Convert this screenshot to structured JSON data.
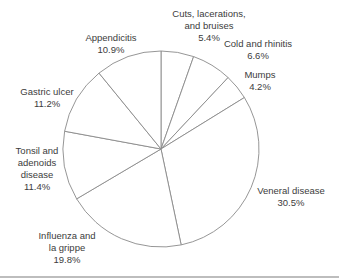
{
  "chart_data": {
    "type": "pie",
    "title": "",
    "start_angle": "12 o'clock",
    "direction": "clockwise",
    "legend": "none (labels placed outside slices)",
    "slice_fill": "#ffffff",
    "slice_stroke": "#8a8a8a",
    "slices": [
      {
        "label": "Cuts, lacerations, and bruises",
        "lines": [
          "Cuts, lacerations,",
          "and bruises"
        ],
        "value": 5.4,
        "pct_label": "5.4%"
      },
      {
        "label": "Cold and rhinitis",
        "lines": [
          "Cold and rhinitis"
        ],
        "value": 6.6,
        "pct_label": "6.6%"
      },
      {
        "label": "Mumps",
        "lines": [
          "Mumps"
        ],
        "value": 4.2,
        "pct_label": "4.2%"
      },
      {
        "label": "Veneral disease",
        "lines": [
          "Veneral disease"
        ],
        "value": 30.5,
        "pct_label": "30.5%"
      },
      {
        "label": "Influenza and la grippe",
        "lines": [
          "Influenza and",
          "la grippe"
        ],
        "value": 19.8,
        "pct_label": "19.8%"
      },
      {
        "label": "Tonsil and adenoids disease",
        "lines": [
          "Tonsil and",
          "adenoids",
          "disease"
        ],
        "value": 11.4,
        "pct_label": "11.4%"
      },
      {
        "label": "Gastric ulcer",
        "lines": [
          "Gastric ulcer"
        ],
        "value": 11.2,
        "pct_label": "11.2%"
      },
      {
        "label": "Appendicitis",
        "lines": [
          "Appendicitis"
        ],
        "value": 10.9,
        "pct_label": "10.9%"
      }
    ]
  },
  "labels": {
    "cuts": {
      "l1": "Cuts, lacerations,",
      "l2": "and bruises",
      "pct": "5.4%"
    },
    "cold": {
      "l1": "Cold and rhinitis",
      "pct": "6.6%"
    },
    "mumps": {
      "l1": "Mumps",
      "pct": "4.2%"
    },
    "veneral": {
      "l1": "Veneral disease",
      "pct": "30.5%"
    },
    "influenza": {
      "l1": "Influenza and",
      "l2": "la grippe",
      "pct": "19.8%"
    },
    "tonsil": {
      "l1": "Tonsil and",
      "l2": "adenoids",
      "l3": "disease",
      "pct": "11.4%"
    },
    "gastric": {
      "l1": "Gastric ulcer",
      "pct": "11.2%"
    },
    "appendicitis": {
      "l1": "Appendicitis",
      "pct": "10.9%"
    }
  }
}
